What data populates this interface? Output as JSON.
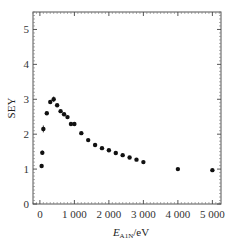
{
  "chart_data": {
    "type": "scatter",
    "title": "",
    "xlabel": "E_A1N/eV",
    "xlabel_main": "E",
    "xlabel_sub": "A1N",
    "xlabel_unit": "/eV",
    "ylabel": "SEY",
    "xlim": [
      -200,
      5250
    ],
    "ylim": [
      0,
      5.5
    ],
    "xticks": [
      0,
      1000,
      2000,
      3000,
      4000,
      5000
    ],
    "xtick_labels": [
      "0",
      "1 000",
      "2 000",
      "3 000",
      "4 000",
      "5 000"
    ],
    "yticks": [
      0,
      1,
      2,
      3,
      4,
      5
    ],
    "ytick_labels": [
      "0",
      "1",
      "2",
      "3",
      "4",
      "5"
    ],
    "grid": false,
    "legend": null,
    "series": [
      {
        "name": "SEY",
        "marker": "filled-circle",
        "color": "#111111",
        "x": [
          50,
          70,
          100,
          200,
          300,
          400,
          500,
          600,
          700,
          800,
          900,
          1000,
          1200,
          1400,
          1600,
          1800,
          2000,
          2200,
          2400,
          2600,
          2800,
          3000,
          4000,
          5000
        ],
        "y": [
          1.09,
          1.47,
          2.15,
          2.6,
          2.92,
          3.0,
          2.83,
          2.66,
          2.57,
          2.49,
          2.29,
          2.29,
          2.03,
          1.83,
          1.69,
          1.6,
          1.54,
          1.46,
          1.4,
          1.33,
          1.27,
          1.2,
          1.0,
          0.97
        ],
        "yerr": [
          0.04,
          0.06,
          0.1,
          0.04,
          0.05,
          0.08,
          0.03,
          0.03,
          0.03,
          0.03,
          0.04,
          0.04,
          0.03,
          0.03,
          0.03,
          0.03,
          0.03,
          0.03,
          0.03,
          0.03,
          0.03,
          0.03,
          0.03,
          0.03
        ]
      }
    ]
  }
}
